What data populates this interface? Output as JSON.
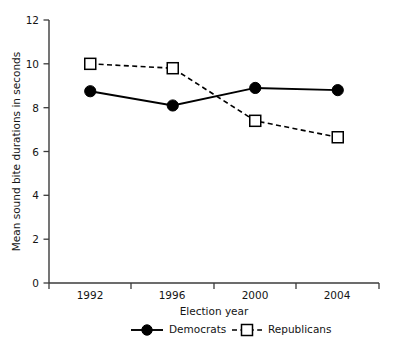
{
  "chart_data": {
    "type": "line",
    "title": "",
    "xlabel": "Election year",
    "ylabel": "Mean sound bite durations in seconds",
    "categories": [
      "1992",
      "1996",
      "2000",
      "2004"
    ],
    "x": [
      1992,
      1996,
      2000,
      2004
    ],
    "series": [
      {
        "name": "Democrats",
        "values": [
          8.75,
          8.1,
          8.9,
          8.8
        ],
        "marker": "filled-circle",
        "linestyle": "solid",
        "color": "#000000"
      },
      {
        "name": "Republicans",
        "values": [
          10.0,
          9.8,
          7.4,
          6.65
        ],
        "marker": "open-square",
        "linestyle": "dashed",
        "color": "#000000"
      }
    ],
    "ylim": [
      0,
      12
    ],
    "yticks": [
      0,
      2,
      4,
      6,
      8,
      10,
      12
    ],
    "ytick_labels": [
      "0",
      "2",
      "4",
      "6",
      "8",
      "10",
      "12"
    ],
    "xtick_labels": [
      "1992",
      "1996",
      "2000",
      "2004"
    ],
    "grid": false,
    "legend_position": "bottom",
    "background_color": "#ffffff",
    "axis_color": "#3b3b3b"
  },
  "axes": {
    "y_title": "Mean sound bite durations in seconds",
    "x_title": "Election year",
    "y_ticks": [
      "12",
      "10",
      "8",
      "6",
      "4",
      "2",
      "0"
    ],
    "x_ticks": [
      "1992",
      "1996",
      "2000",
      "2004"
    ]
  },
  "legend": {
    "items": [
      {
        "label": "Democrats",
        "marker": "filled-circle-icon",
        "line": "solid"
      },
      {
        "label": "Republicans",
        "marker": "open-square-icon",
        "line": "dashed"
      }
    ]
  }
}
